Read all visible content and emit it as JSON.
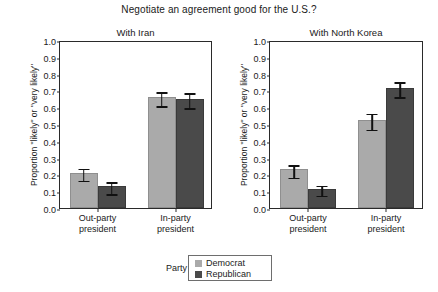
{
  "chart_data": {
    "type": "bar",
    "title": "Negotiate an agreement good for the U.S.?",
    "xlabel": "",
    "ylabel": "Proportion \"likely\" or \"very likely\"",
    "ylim": [
      0.0,
      1.0
    ],
    "yticks": [
      "0.0",
      "0.1",
      "0.2",
      "0.3",
      "0.4",
      "0.5",
      "0.6",
      "0.7",
      "0.8",
      "0.9",
      "1.0"
    ],
    "grid": false,
    "legend": {
      "title": "Party",
      "position": "bottom-center",
      "entries": [
        {
          "name": "Democrat",
          "color": "#aaaaaa"
        },
        {
          "name": "Republican",
          "color": "#4a4a4a"
        }
      ]
    },
    "categories": [
      "Out-party president",
      "In-party president"
    ],
    "category_lines": [
      [
        "Out-party",
        "president"
      ],
      [
        "In-party",
        "president"
      ]
    ],
    "panels": [
      {
        "title": "With Iran",
        "series": [
          {
            "name": "Democrat",
            "color": "#aaaaaa",
            "values": [
              0.21,
              0.66
            ],
            "errors": [
              0.035,
              0.042
            ]
          },
          {
            "name": "Republican",
            "color": "#4a4a4a",
            "values": [
              0.13,
              0.65
            ],
            "errors": [
              0.035,
              0.045
            ]
          }
        ]
      },
      {
        "title": "With North Korea",
        "series": [
          {
            "name": "Democrat",
            "color": "#aaaaaa",
            "values": [
              0.23,
              0.525
            ],
            "errors": [
              0.038,
              0.047
            ]
          },
          {
            "name": "Republican",
            "color": "#4a4a4a",
            "values": [
              0.115,
              0.715
            ],
            "errors": [
              0.03,
              0.045
            ]
          }
        ]
      }
    ]
  }
}
